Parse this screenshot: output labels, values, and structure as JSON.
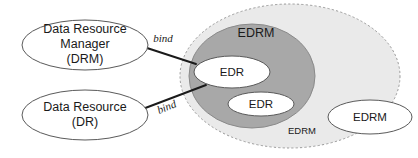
{
  "diagram": {
    "colors": {
      "outer_region_fill": "#eaeaea",
      "outer_region_stroke": "#9a9a9a",
      "inner_region_fill": "#a8a8a8",
      "inner_region_stroke": "#8a8a8a",
      "node_fill": "#ffffff",
      "node_stroke": "#5a5a5a",
      "text": "#1a1a1a",
      "connector": "#1a1a1a"
    },
    "left_nodes": [
      {
        "id": "drm",
        "shape": "ellipse",
        "line1": "Data Resource",
        "line2": "Manager",
        "line3": "(DRM)",
        "cx": 85,
        "cy": 45,
        "rx": 63,
        "ry": 25
      },
      {
        "id": "dr",
        "shape": "ellipse",
        "line1": "Data Resource",
        "line2": "(DR)",
        "line3": "",
        "cx": 85,
        "cy": 115,
        "rx": 63,
        "ry": 25
      }
    ],
    "regions": [
      {
        "id": "outer-edrm",
        "label": "EDRM",
        "shape": "ellipse-dashed",
        "cx": 290,
        "cy": 76,
        "rx": 110,
        "ry": 72,
        "label_x": 302,
        "label_y": 131
      },
      {
        "id": "inner-edrm",
        "label": "EDRM",
        "shape": "ellipse-filled",
        "cx": 252,
        "cy": 76,
        "rx": 63,
        "ry": 52,
        "label_x": 256,
        "label_y": 34
      }
    ],
    "inner_nodes": [
      {
        "id": "edr-1",
        "label": "EDR",
        "cx": 232,
        "cy": 72,
        "rx": 38,
        "ry": 16
      },
      {
        "id": "edr-2",
        "label": "EDR",
        "cx": 261,
        "cy": 104,
        "rx": 33,
        "ry": 12
      },
      {
        "id": "edrm-right",
        "label": "EDRM",
        "cx": 370,
        "cy": 117,
        "rx": 42,
        "ry": 17
      }
    ],
    "connectors": [
      {
        "id": "bind-upper",
        "label": "bind",
        "from_x": 147,
        "from_y": 48,
        "to_x": 196,
        "to_y": 64,
        "label_x": 163,
        "label_y": 39,
        "label_rotation": 0
      },
      {
        "id": "bind-lower",
        "label": "bind",
        "from_x": 140,
        "from_y": 110,
        "to_x": 206,
        "to_y": 85,
        "label_x": 167,
        "label_y": 108,
        "label_rotation": -22
      }
    ]
  }
}
